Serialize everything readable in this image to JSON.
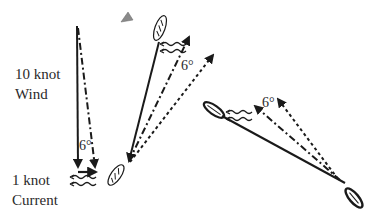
{
  "labels": {
    "wind_line1": "10 knot",
    "wind_line2": "Wind",
    "current_line1": "1 knot",
    "current_line2": "Current"
  },
  "angles": {
    "left": "6°",
    "middle": "6°",
    "right": "6°"
  },
  "legend_icons": [
    "solid-arrow: wind vector",
    "dash-dot-arrow: apparent/resultant",
    "dotted-arrow: course over ground",
    "wavy-arrows: current",
    "boat-icon",
    "mark-buoy-icon"
  ],
  "colors": {
    "ink": "#1a1a1a",
    "buoy": "#8a8a8a",
    "background": "#ffffff"
  }
}
